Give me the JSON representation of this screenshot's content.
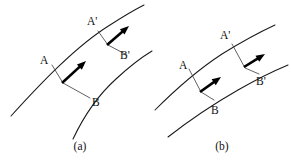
{
  "figure": {
    "background_color": "#ffffff",
    "stroke_color": "#1a1a1a",
    "arrow_color": "#000000",
    "connector_color": "#444444",
    "width": 291,
    "height": 160
  },
  "panels": [
    {
      "id": "a",
      "caption": "(a)",
      "caption_x": 80,
      "caption_y": 141,
      "labels": [
        {
          "name": "point-a",
          "text": "A",
          "x": 40,
          "y": 55
        },
        {
          "name": "point-a-prime",
          "text": "A'",
          "x": 87,
          "y": 16
        },
        {
          "name": "point-b",
          "text": "B",
          "x": 92,
          "y": 97
        },
        {
          "name": "point-b-prime",
          "text": "B'",
          "x": 120,
          "y": 50
        }
      ],
      "curves": [
        {
          "name": "upper-streamline",
          "d": "M 11 116 C 40 84 76 46 110 25 C 124 16 136 9 144 5"
        },
        {
          "name": "lower-streamline",
          "d": "M 73 139 C 82 120 96 97 116 79 C 130 66 142 57 152 51"
        }
      ],
      "connectors": [
        {
          "name": "connector-ab",
          "d": "M 52 65 L 63 83 L 90 98"
        },
        {
          "name": "connector-ab-prime",
          "d": "M 98 31 L 108 45 L 127 55"
        }
      ],
      "arrows": [
        {
          "name": "velocity-arrow-ab",
          "x1": 62,
          "y1": 83,
          "x2": 86,
          "y2": 61
        },
        {
          "name": "velocity-arrow-ab-prime",
          "x1": 107,
          "y1": 45,
          "x2": 129,
          "y2": 26
        }
      ]
    },
    {
      "id": "b",
      "caption": "(b)",
      "caption_x": 222,
      "caption_y": 141,
      "labels": [
        {
          "name": "point-a",
          "text": "A",
          "x": 179,
          "y": 60
        },
        {
          "name": "point-a-prime",
          "text": "A'",
          "x": 220,
          "y": 30
        },
        {
          "name": "point-b",
          "text": "B",
          "x": 211,
          "y": 105
        },
        {
          "name": "point-b-prime",
          "text": "B'",
          "x": 256,
          "y": 76
        }
      ],
      "curves": [
        {
          "name": "upper-streamline",
          "d": "M 155 110 C 172 93 196 71 222 54 C 243 41 262 31 275 25"
        },
        {
          "name": "lower-streamline",
          "d": "M 168 137 C 186 123 210 106 238 90 C 259 78 276 70 288 65"
        }
      ],
      "connectors": [
        {
          "name": "connector-ab",
          "d": "M 189 69 L 201 92 L 214 100"
        },
        {
          "name": "connector-ab-prime",
          "d": "M 232 44 L 245 68 L 259 74"
        }
      ],
      "arrows": [
        {
          "name": "velocity-arrow-ab",
          "x1": 200,
          "y1": 92,
          "x2": 221,
          "y2": 77
        },
        {
          "name": "velocity-arrow-ab-prime",
          "x1": 244,
          "y1": 67,
          "x2": 265,
          "y2": 54
        }
      ]
    }
  ]
}
